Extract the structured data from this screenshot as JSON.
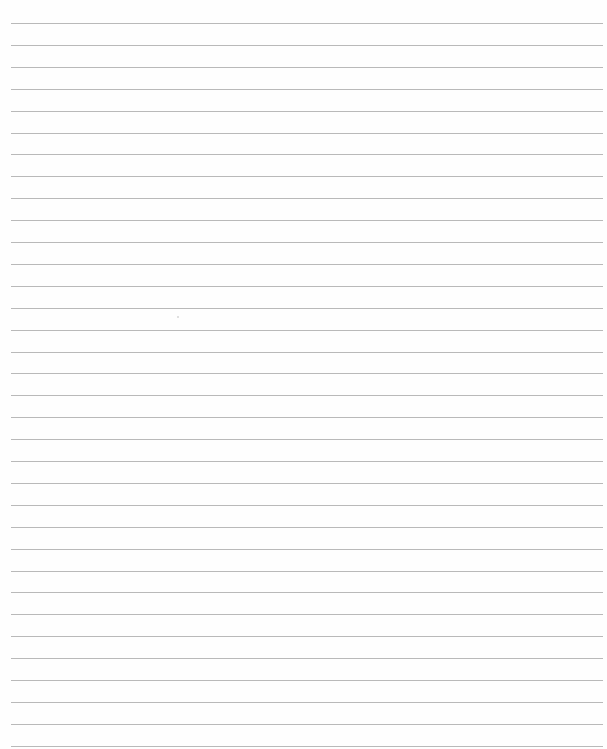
{
  "page": {
    "type": "lined-paper",
    "background_color": "#fefefe",
    "line_color": "#b9b9b9",
    "line_count": 34,
    "first_line_y": 23,
    "line_spacing": 21.9,
    "line_left": 11,
    "line_right": 603,
    "text": ""
  }
}
